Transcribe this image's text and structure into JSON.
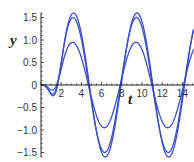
{
  "chart_data": {
    "type": "line",
    "title": "",
    "xlabel": "t",
    "ylabel": "y",
    "xlim": [
      0,
      15
    ],
    "ylim": [
      -1.6,
      1.6
    ],
    "x_ticks": [
      2,
      4,
      6,
      8,
      10,
      12,
      14
    ],
    "y_ticks": [
      1.5,
      1.0,
      0.5,
      0,
      -0.5,
      -1.0,
      -1.5
    ],
    "y_tick_labels": [
      "1.5",
      "1.0",
      "0.5",
      "0",
      "−0.5",
      "−1.0",
      "−1.5"
    ],
    "grid": false,
    "legend": null,
    "line_color": "#3a4fc4",
    "series": [
      {
        "name": "curve-1",
        "peak_values": [
          {
            "t": 3.0,
            "y": 0.95
          },
          {
            "t": 9.3,
            "y": 0.95
          }
        ],
        "trough_values": [
          {
            "t": 6.2,
            "y": -0.92
          },
          {
            "t": 12.5,
            "y": -0.95
          }
        ]
      },
      {
        "name": "curve-2",
        "peak_values": [
          {
            "t": 3.1,
            "y": 1.5
          },
          {
            "t": 9.4,
            "y": 1.5
          }
        ],
        "trough_values": [
          {
            "t": 6.3,
            "y": -1.45
          },
          {
            "t": 12.6,
            "y": -1.5
          }
        ]
      },
      {
        "name": "curve-3",
        "peak_values": [
          {
            "t": 3.2,
            "y": 1.6
          },
          {
            "t": 9.5,
            "y": 1.6
          }
        ],
        "trough_values": [
          {
            "t": 6.4,
            "y": -1.55
          },
          {
            "t": 12.7,
            "y": -1.6
          }
        ]
      }
    ],
    "curve_params": [
      {
        "amp": 0.95,
        "phase": 0.0
      },
      {
        "amp": 1.5,
        "phase": 0.1
      },
      {
        "amp": 1.6,
        "phase": 0.2
      }
    ]
  }
}
